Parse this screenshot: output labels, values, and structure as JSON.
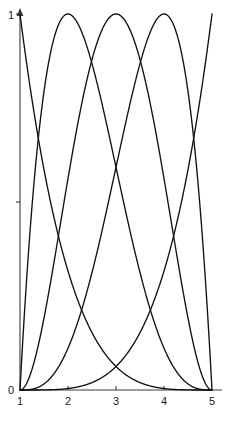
{
  "chart_data": {
    "type": "line",
    "title": "",
    "subtitle": "",
    "xlabel": "",
    "ylabel": "",
    "xlim": [
      1,
      5
    ],
    "ylim": [
      0,
      1
    ],
    "grid": false,
    "legend": false,
    "legend_position": "none",
    "x_ticks": [
      {
        "value": 1,
        "label": "1"
      },
      {
        "value": 2,
        "label": "2"
      },
      {
        "value": 3,
        "label": "3"
      },
      {
        "value": 4,
        "label": "4"
      },
      {
        "value": 5,
        "label": "5"
      }
    ],
    "y_ticks": [
      {
        "value": 0,
        "label": "0"
      },
      {
        "value": 0.5,
        "label": ""
      },
      {
        "value": 1,
        "label": "1"
      }
    ],
    "line_color": "#111111",
    "axis_color": "#3a3a3a",
    "series": [
      {
        "name": "N0",
        "note": "decreasing from (1,1) to (5,0)",
        "x": [
          1,
          1.2,
          1.4,
          1.6,
          1.8,
          2,
          2.2,
          2.4,
          2.6,
          2.8,
          3,
          3.2,
          3.4,
          3.6,
          3.8,
          4,
          4.2,
          4.4,
          4.6,
          4.8,
          5
        ],
        "y": [
          1,
          0.815,
          0.656,
          0.522,
          0.41,
          0.316,
          0.24,
          0.179,
          0.13,
          0.092,
          0.063,
          0.041,
          0.026,
          0.015,
          0.008,
          0.004,
          0.0015,
          0.0004,
          0.0001,
          0,
          0
        ]
      },
      {
        "name": "N1",
        "note": "peak near x=2.06, height 1",
        "x": [
          1,
          1.2,
          1.4,
          1.6,
          1.8,
          2,
          2.2,
          2.4,
          2.6,
          2.8,
          3,
          3.2,
          3.4,
          3.6,
          3.8,
          4,
          4.2,
          4.4,
          4.6,
          4.8,
          5
        ],
        "y": [
          0,
          0.644,
          0.898,
          0.995,
          0.995,
          0.937,
          0.844,
          0.733,
          0.616,
          0.5,
          0.391,
          0.292,
          0.206,
          0.135,
          0.079,
          0.039,
          0.014,
          0.003,
          0.0002,
          0,
          0
        ]
      },
      {
        "name": "N2",
        "note": "peak near x=3.05, height 1",
        "x": [
          1,
          1.2,
          1.4,
          1.6,
          1.8,
          2,
          2.2,
          2.4,
          2.6,
          2.8,
          3,
          3.2,
          3.4,
          3.6,
          3.8,
          4,
          4.2,
          4.4,
          4.6,
          4.8,
          5
        ],
        "y": [
          0,
          0.127,
          0.307,
          0.474,
          0.604,
          0.694,
          0.742,
          0.754,
          0.73,
          0.677,
          0.602,
          0.512,
          0.414,
          0.313,
          0.215,
          0.129,
          0.06,
          0.016,
          0.001,
          0,
          0
        ]
      },
      {
        "name": "N3",
        "note": "peak near x=4.02, height 1",
        "x": [
          1,
          1.2,
          1.4,
          1.6,
          1.8,
          2,
          2.2,
          2.4,
          2.6,
          2.8,
          3,
          3.2,
          3.4,
          3.6,
          3.8,
          4,
          4.2,
          4.4,
          4.6,
          4.8,
          5
        ],
        "y": [
          0,
          0.011,
          0.047,
          0.107,
          0.185,
          0.275,
          0.37,
          0.464,
          0.551,
          0.625,
          0.68,
          0.71,
          0.713,
          0.682,
          0.614,
          0.504,
          0.35,
          0.175,
          0.031,
          0.0003,
          0
        ]
      },
      {
        "name": "N4",
        "note": "increasing from (1,0) to (5,1)",
        "x": [
          1,
          1.2,
          1.4,
          1.6,
          1.8,
          2,
          2.2,
          2.4,
          2.6,
          2.8,
          3,
          3.2,
          3.4,
          3.6,
          3.8,
          4,
          4.2,
          4.4,
          4.6,
          4.8,
          5
        ],
        "y": [
          0,
          0.0006,
          0.004,
          0.013,
          0.032,
          0.063,
          0.109,
          0.173,
          0.26,
          0.372,
          0.5,
          0.64,
          0.78,
          0.9,
          0.98,
          1.0,
          0.0,
          0.0,
          0.0,
          0.0,
          0.0
        ]
      }
    ]
  },
  "geometry": {
    "plot_left_px": 20,
    "plot_right_px": 212,
    "plot_bottom_px": 390,
    "plot_top_px": 14,
    "x_axis_end_px": 222,
    "y_axis_top_px": 10
  }
}
